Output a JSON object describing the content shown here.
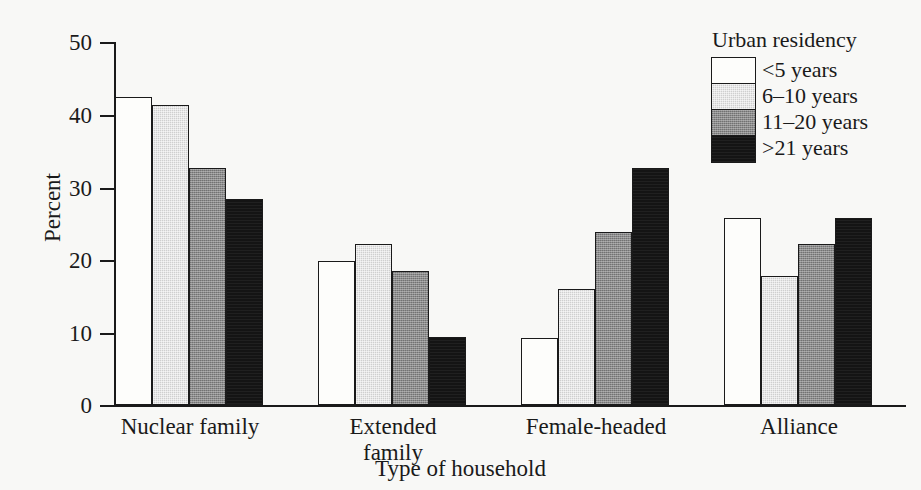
{
  "chart_data": {
    "type": "bar",
    "title": "",
    "xlabel": "Type of household",
    "ylabel": "Percent",
    "categories": [
      "Nuclear family",
      "Extended family",
      "Female-headed",
      "Alliance"
    ],
    "legend_title": "Urban residency",
    "legend_position": "top-right",
    "grid": false,
    "ylim": [
      0,
      50
    ],
    "yticks": [
      0,
      10,
      20,
      30,
      40,
      50
    ],
    "ytick_labels": [
      "0",
      "10",
      "20",
      "30",
      "40",
      "50"
    ],
    "series": [
      {
        "name": "<5 years",
        "swatch": "white",
        "color": "#fdfdfb",
        "values": [
          42.4,
          19.8,
          9.2,
          25.7
        ]
      },
      {
        "name": "6–10 years",
        "swatch": "light-gray",
        "color": "#cfcfcf",
        "values": [
          41.3,
          22.2,
          16.0,
          17.8
        ]
      },
      {
        "name": "11–20 years",
        "swatch": "medium-gray",
        "color": "#8b8b8b",
        "values": [
          32.6,
          18.4,
          23.8,
          22.2
        ]
      },
      {
        "name": ">21 years",
        "swatch": "black",
        "color": "#141414",
        "values": [
          28.4,
          9.4,
          32.6,
          25.8
        ]
      }
    ]
  }
}
